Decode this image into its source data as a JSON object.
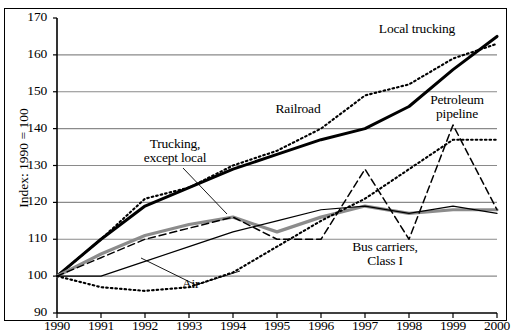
{
  "chart_data": {
    "type": "line",
    "title": "",
    "xlabel": "",
    "ylabel": "Index: 1990 = 100",
    "x": [
      1990,
      1991,
      1992,
      1993,
      1994,
      1995,
      1996,
      1997,
      1998,
      1999,
      2000
    ],
    "xlim": [
      1990,
      2000
    ],
    "ylim": [
      90,
      170
    ],
    "yticks": [
      90,
      100,
      110,
      120,
      130,
      140,
      150,
      160,
      170
    ],
    "xticks": [
      "1990",
      "1991",
      "1992",
      "1993",
      "1994",
      "1995",
      "1996",
      "1997",
      "1998",
      "1999",
      "2000"
    ],
    "grid": "horizontal",
    "legend": "inline-annotations",
    "series": [
      {
        "name": "Local trucking",
        "style": "thick-solid-black",
        "color": "#000000",
        "values": [
          100,
          110,
          119,
          124,
          129,
          133,
          137,
          140,
          146,
          156,
          165
        ]
      },
      {
        "name": "Railroad",
        "style": "dotted-black",
        "color": "#000000",
        "values": [
          100,
          110,
          121,
          124,
          130,
          134,
          140,
          149,
          152,
          159,
          163
        ]
      },
      {
        "name": "Trucking, except local",
        "style": "thick-solid-gray",
        "color": "#8c8c8c",
        "values": [
          100,
          106,
          111,
          114,
          116,
          112,
          116,
          119,
          117,
          118,
          118
        ]
      },
      {
        "name": "Air",
        "style": "thin-solid-black",
        "color": "#000000",
        "values": [
          100,
          100,
          104,
          108,
          112,
          115,
          118,
          119,
          117,
          119,
          117
        ]
      },
      {
        "name": "Bus carriers, Class I",
        "style": "dashed-black",
        "color": "#000000",
        "values": [
          100,
          105,
          110,
          113,
          116,
          110,
          110,
          129,
          110,
          141,
          118
        ]
      },
      {
        "name": "Petroleum pipeline",
        "style": "dotted-black-lower",
        "color": "#000000",
        "values": [
          100,
          97,
          96,
          97,
          101,
          108,
          115,
          121,
          129,
          137,
          137
        ]
      }
    ],
    "annotations": [
      {
        "label": "Local trucking",
        "series": "Local trucking"
      },
      {
        "label": "Railroad",
        "series": "Railroad"
      },
      {
        "label": "Petroleum\npipeline",
        "series": "Petroleum pipeline"
      },
      {
        "label": "Trucking,\nexcept local",
        "series": "Trucking, except local"
      },
      {
        "label": "Air",
        "series": "Air"
      },
      {
        "label": "Bus carriers,\nClass I",
        "series": "Bus carriers, Class I"
      }
    ]
  },
  "axis": {
    "y_title": "Index: 1990 = 100",
    "y_ticks": [
      "170",
      "160",
      "150",
      "140",
      "130",
      "120",
      "110",
      "100",
      "90"
    ],
    "x_ticks": [
      "1990",
      "1991",
      "1992",
      "1993",
      "1994",
      "1995",
      "1996",
      "1997",
      "1998",
      "1999",
      "2000"
    ]
  },
  "annotations": {
    "local_trucking": "Local trucking",
    "railroad": "Railroad",
    "petroleum_line1": "Petroleum",
    "petroleum_line2": "pipeline",
    "trucking_line1": "Trucking,",
    "trucking_line2": "except local",
    "air": "Air",
    "bus_line1": "Bus carriers,",
    "bus_line2": "Class I"
  },
  "colors": {
    "grid": "#8a8a8a",
    "axis": "#000000",
    "gray_series": "#8c8c8c",
    "background": "#ffffff"
  }
}
